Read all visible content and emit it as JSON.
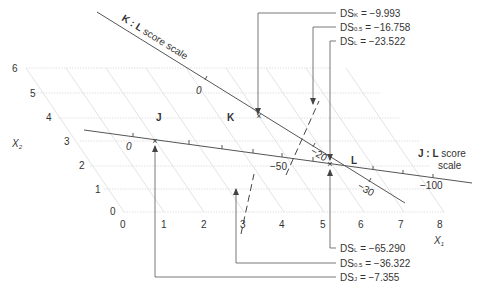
{
  "axes": {
    "x1_label": "X",
    "x1_sub": "1",
    "x2_label": "X",
    "x2_sub": "2",
    "x1_ticks": [
      "0",
      "1",
      "2",
      "3",
      "4",
      "5",
      "6",
      "7",
      "8"
    ],
    "x2_ticks": [
      "0",
      "1",
      "2",
      "3",
      "4",
      "5",
      "6"
    ]
  },
  "points": {
    "J": "J",
    "K": "K",
    "L": "L"
  },
  "scales": {
    "kl": {
      "title_bold": "K : L",
      "title_rest": " score scale",
      "tick_0": "0",
      "tick_20": "−20",
      "tick_30": "−30"
    },
    "jl": {
      "title_bold": "J : L",
      "title_rest": " score",
      "title_line2": "scale",
      "tick_0": "0",
      "tick_50": "−50",
      "tick_100": "−100"
    }
  },
  "annotations": {
    "top": [
      {
        "label": "DS",
        "sub": "K",
        "value": "= −9.993"
      },
      {
        "label": "DS",
        "sub": "0.5",
        "value": "= −16.758"
      },
      {
        "label": "DS",
        "sub": "L",
        "value": "= −23.522"
      }
    ],
    "bottom": [
      {
        "label": "DS",
        "sub": "L",
        "value": "= −65.290"
      },
      {
        "label": "DS",
        "sub": "0.5",
        "value": "= −36.322"
      },
      {
        "label": "DS",
        "sub": "J",
        "value": "= −7.355"
      }
    ]
  }
}
